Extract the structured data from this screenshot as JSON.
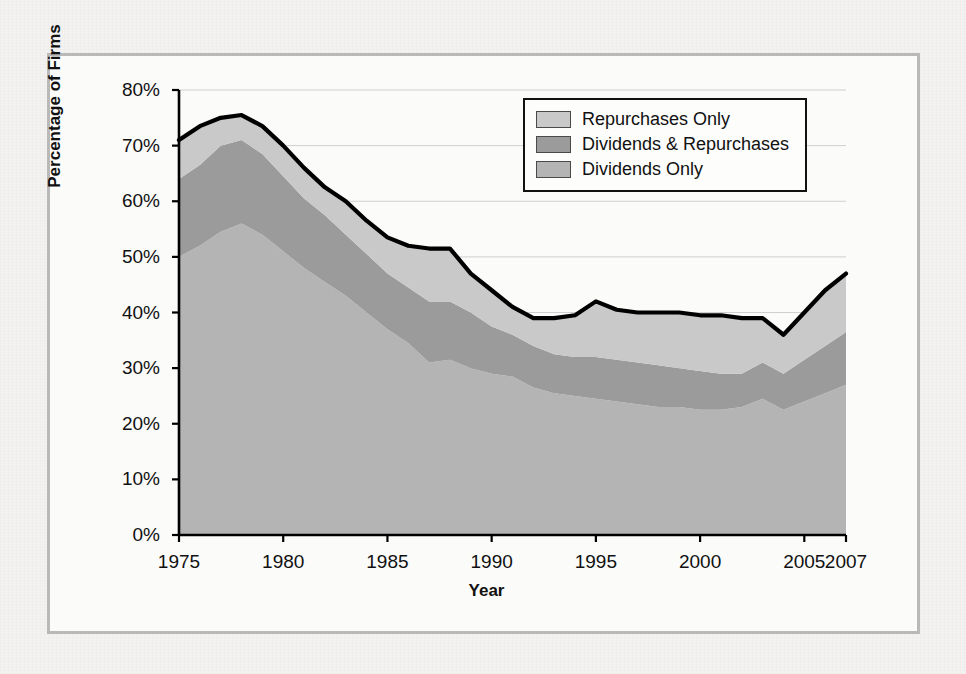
{
  "figure": {
    "ylabel": "Percentage of Firms",
    "xlabel": "Year"
  },
  "legend": {
    "items": [
      {
        "label": "Repurchases Only",
        "color": "#c9c9c9"
      },
      {
        "label": "Dividends & Repurchases",
        "color": "#9b9b9b"
      },
      {
        "label": "Dividends Only",
        "color": "#b4b4b4"
      }
    ]
  },
  "axes": {
    "yticks": [
      "0%",
      "10%",
      "20%",
      "30%",
      "40%",
      "50%",
      "60%",
      "70%",
      "80%"
    ],
    "ytick_values": [
      0,
      10,
      20,
      30,
      40,
      50,
      60,
      70,
      80
    ],
    "xticks": [
      "1975",
      "1980",
      "1985",
      "1990",
      "1995",
      "2000",
      "2005",
      "2007"
    ],
    "xtick_values": [
      1975,
      1980,
      1985,
      1990,
      1995,
      2000,
      2005,
      2007
    ]
  },
  "chart_data": {
    "type": "area",
    "stacked": true,
    "title": "",
    "xlabel": "Year",
    "ylabel": "Percentage of Firms",
    "xlim": [
      1975,
      2007
    ],
    "ylim": [
      0,
      80
    ],
    "grid": true,
    "legend_position": "top-right",
    "x": [
      1975,
      1976,
      1977,
      1978,
      1979,
      1980,
      1981,
      1982,
      1983,
      1984,
      1985,
      1986,
      1987,
      1988,
      1989,
      1990,
      1991,
      1992,
      1993,
      1994,
      1995,
      1996,
      1997,
      1998,
      1999,
      2000,
      2001,
      2002,
      2003,
      2004,
      2005,
      2006,
      2007
    ],
    "series": [
      {
        "name": "Dividends Only",
        "color": "#b4b4b4",
        "values": [
          50.0,
          52.0,
          54.5,
          56.0,
          54.0,
          51.0,
          48.0,
          45.5,
          43.0,
          40.0,
          37.0,
          34.5,
          31.0,
          31.5,
          30.0,
          29.0,
          28.5,
          26.5,
          25.5,
          25.0,
          24.5,
          24.0,
          23.5,
          23.0,
          23.0,
          22.5,
          22.5,
          23.0,
          24.5,
          22.5,
          24.0,
          25.5,
          27.0
        ]
      },
      {
        "name": "Dividends & Repurchases",
        "color": "#9b9b9b",
        "values": [
          14.0,
          14.5,
          15.5,
          15.0,
          14.5,
          13.5,
          12.5,
          12.0,
          11.0,
          10.5,
          10.0,
          10.0,
          11.0,
          10.5,
          10.0,
          8.5,
          7.5,
          7.5,
          7.0,
          7.0,
          7.5,
          7.5,
          7.5,
          7.5,
          7.0,
          7.0,
          6.5,
          6.0,
          6.5,
          6.5,
          7.5,
          8.5,
          9.5
        ]
      },
      {
        "name": "Repurchases Only",
        "color": "#c9c9c9",
        "values": [
          7.0,
          7.0,
          5.0,
          4.5,
          5.0,
          5.5,
          5.5,
          5.0,
          6.0,
          6.0,
          6.5,
          7.5,
          9.5,
          9.5,
          7.0,
          6.5,
          5.0,
          5.0,
          6.5,
          7.5,
          10.0,
          9.0,
          9.0,
          9.5,
          10.0,
          10.0,
          10.5,
          10.0,
          8.0,
          7.0,
          8.5,
          10.0,
          10.5
        ]
      }
    ],
    "total": [
      71.0,
      73.5,
      75.0,
      75.5,
      73.5,
      70.0,
      66.0,
      62.5,
      60.0,
      56.5,
      53.5,
      52.0,
      51.5,
      51.5,
      47.0,
      44.0,
      41.0,
      39.0,
      39.0,
      39.5,
      42.0,
      40.5,
      40.0,
      40.0,
      40.0,
      39.5,
      39.5,
      39.0,
      39.0,
      36.0,
      40.0,
      44.0,
      47.0
    ],
    "total_line_color": "#000000"
  }
}
